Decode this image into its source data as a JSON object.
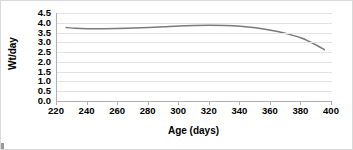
{
  "chart_data": {
    "type": "line",
    "title": "",
    "xlabel": "Age (days)",
    "ylabel": "Wt/day",
    "xlim": [
      220,
      400
    ],
    "ylim": [
      0.0,
      4.5
    ],
    "xticks": [
      220,
      240,
      260,
      280,
      300,
      320,
      340,
      360,
      380,
      400
    ],
    "xtick_labels": [
      "220",
      "240",
      "260",
      "280",
      "300",
      "320",
      "340",
      "360",
      "380",
      "400"
    ],
    "yticks": [
      0.0,
      0.5,
      1.0,
      1.5,
      2.0,
      2.5,
      3.0,
      3.5,
      4.0,
      4.5
    ],
    "ytick_labels": [
      "0.0",
      "0.5",
      "1.0",
      "1.5",
      "2.0",
      "2.5",
      "3.0",
      "3.5",
      "4.0",
      "4.5"
    ],
    "grid": true,
    "grid_axis": "y",
    "grid_color": "#e3e3e3",
    "legend": false,
    "line_color": "#7a7a7a",
    "line_width": 1.5,
    "series": [
      {
        "name": "Wt/day",
        "x": [
          226,
          232,
          240,
          250,
          260,
          270,
          280,
          290,
          300,
          310,
          320,
          330,
          340,
          350,
          360,
          370,
          380,
          390,
          395
        ],
        "values": [
          3.76,
          3.72,
          3.7,
          3.7,
          3.71,
          3.73,
          3.76,
          3.8,
          3.84,
          3.86,
          3.87,
          3.86,
          3.82,
          3.74,
          3.62,
          3.45,
          3.22,
          2.85,
          2.62
        ]
      }
    ]
  }
}
